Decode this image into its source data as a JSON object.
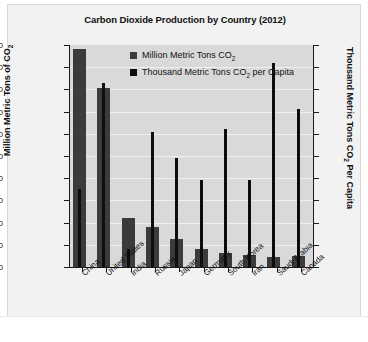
{
  "chart_data": {
    "type": "bar",
    "title": "Carbon Dioxide Production by Country (2012)",
    "xlabel": "",
    "ylabel": "Million Metric Tons of CO2",
    "ylabel_secondary": "Thousand Metric Tons CO2 Per Capita",
    "ylim": [
      0,
      10000
    ],
    "ylim_secondary": [
      0,
      20000
    ],
    "yticks": [
      10000,
      9000,
      8000,
      7000,
      6000,
      5000,
      4000,
      3000,
      2000,
      1000,
      0
    ],
    "yticks_secondary": [
      20000,
      18000,
      16000,
      14000,
      12000,
      10000,
      8000,
      6000,
      4000,
      2000,
      0
    ],
    "grid": true,
    "legend_position": "top-center",
    "categories": [
      "China",
      "United States",
      "India",
      "Russia",
      "Japan",
      "Germany",
      "South Korea",
      "Iran",
      "Saudi Arabia",
      "Canada"
    ],
    "series": [
      {
        "name": "Million Metric Tons CO2",
        "axis": "left",
        "color": "#3b3b3b",
        "values": [
          9800,
          8050,
          2200,
          1800,
          1250,
          800,
          650,
          550,
          450,
          500
        ]
      },
      {
        "name": "Thousand Metric Tons CO2 per Capita",
        "axis": "right",
        "color": "#0d0d0d",
        "values": [
          7000,
          16600,
          1600,
          12200,
          9800,
          7800,
          12400,
          7800,
          18400,
          14200
        ]
      }
    ]
  },
  "chart": {
    "title": "Carbon Dioxide Production by Country (2012)",
    "axis_left_title_pre": "Million Metric Tons of CO",
    "axis_left_title_sub": "2",
    "axis_right_title_pre": "Thousand Metric Tons CO",
    "axis_right_title_sub": "2",
    "axis_right_title_post": " Per Capita",
    "legend": [
      {
        "pre": "Million Metric Tons CO",
        "sub": "2",
        "post": ""
      },
      {
        "pre": "Thousand Metric Tons CO",
        "sub": "2",
        "post": " per Capita"
      }
    ],
    "y_left_ticks": [
      "10000",
      "9000",
      "8000",
      "7000",
      "6000",
      "5000",
      "4000",
      "3000",
      "2000",
      "1000",
      "0"
    ],
    "y_right_ticks": [
      "20000",
      "18000",
      "16000",
      "14000",
      "12000",
      "10000",
      "8000",
      "6000",
      "4000",
      "2000",
      "0"
    ],
    "categories": [
      "China",
      "United States",
      "India",
      "Russia",
      "Japan",
      "Germany",
      "South Korea",
      "Iran",
      "Saudi Arabia",
      "Canada"
    ]
  }
}
